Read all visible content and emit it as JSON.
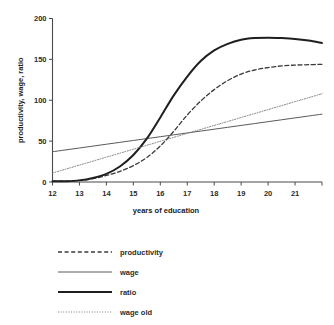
{
  "chart_data": {
    "type": "line",
    "title": "",
    "xlabel": "years of education",
    "ylabel": "productivity, wage, ratio",
    "xlim": [
      12,
      22
    ],
    "ylim": [
      0,
      200
    ],
    "xticks": [
      12,
      13,
      14,
      15,
      16,
      17,
      18,
      19,
      20,
      21,
      22
    ],
    "xtick_labels": [
      "12",
      "13",
      "14",
      "15",
      "16",
      "17",
      "18",
      "19",
      "20",
      "21",
      ""
    ],
    "yticks": [
      0,
      50,
      100,
      150,
      200
    ],
    "ytick_labels": [
      "0",
      "50",
      "100",
      "150",
      "200"
    ],
    "grid": false,
    "legend_position": "below-left",
    "x": [
      12,
      12.5,
      13,
      13.5,
      14,
      14.5,
      15,
      15.5,
      16,
      16.5,
      17,
      17.5,
      18,
      18.5,
      19,
      19.5,
      20,
      20.5,
      21,
      21.5,
      22
    ],
    "series": [
      {
        "name": "productivity",
        "style": "dashed",
        "color": "#3a3a3a",
        "width": 1.3,
        "values": [
          1,
          1,
          2,
          4,
          8,
          13,
          20,
          30,
          44,
          62,
          82,
          99,
          113,
          124,
          132,
          137,
          140,
          142,
          143,
          143.5,
          144
        ]
      },
      {
        "name": "wage",
        "style": "solid-thin",
        "color": "#5a5a5a",
        "width": 1.0,
        "values": [
          37,
          39.3,
          41.6,
          43.9,
          46.2,
          48.5,
          50.8,
          53.1,
          55.4,
          57.7,
          60,
          62.3,
          64.6,
          66.9,
          69.2,
          71.5,
          73.8,
          76.1,
          78.4,
          80.7,
          83
        ]
      },
      {
        "name": "ratio",
        "style": "solid-thick",
        "color": "#1f1f1f",
        "width": 2.0,
        "values": [
          1,
          1,
          2,
          5,
          10,
          19,
          33,
          53,
          79,
          106,
          129,
          148,
          161,
          169,
          174,
          176,
          176.5,
          176,
          175,
          173,
          170
        ]
      },
      {
        "name": "wage old",
        "style": "dotted",
        "color": "#7a7a7a",
        "width": 1.0,
        "values": [
          11,
          15.8,
          20.7,
          25.5,
          30.4,
          35.2,
          40.1,
          44.9,
          49.8,
          54.6,
          59.5,
          64.3,
          69.2,
          74,
          78.9,
          83.7,
          88.6,
          93.4,
          98.3,
          103.1,
          108
        ]
      }
    ]
  },
  "legend": {
    "entries": [
      {
        "label": "productivity",
        "style": "dashed"
      },
      {
        "label": "wage",
        "style": "solid-thin"
      },
      {
        "label": "ratio",
        "style": "solid-thick"
      },
      {
        "label": "wage old",
        "style": "dotted"
      }
    ]
  }
}
